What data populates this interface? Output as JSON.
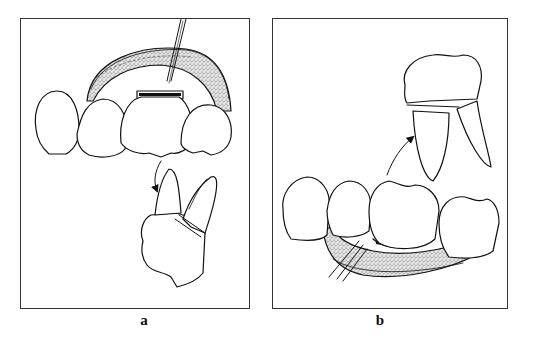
{
  "figure": {
    "panels": [
      {
        "label": "a",
        "description": "Anterior maxillary teeth with mucoperiosteal flap raised; extracted tooth with sectioned root shown below, arrow indicating removal"
      },
      {
        "label": "b",
        "description": "Mandibular molar region with flap raised and instrument sectioning root; extracted molar with separated root shown above, arrow indicating removal"
      }
    ],
    "colors": {
      "line": "#111111",
      "border": "#333333",
      "background": "#ffffff"
    }
  }
}
